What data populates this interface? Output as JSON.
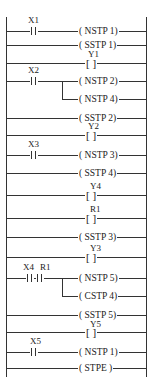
{
  "diagram": {
    "type": "ladder",
    "rungs": [
      {
        "y": 31,
        "contacts": [
          "X1"
        ],
        "output": "( NSTP 1)"
      },
      {
        "y": 45,
        "contacts": [],
        "output": "( SSTP 1)"
      },
      {
        "y": 63,
        "contacts": [],
        "output_label": "Y1",
        "output": "[   ]"
      },
      {
        "y": 81,
        "contacts": [
          "X2"
        ],
        "output": "( NSTP 2)"
      },
      {
        "y": 99,
        "contacts": [],
        "output": "( NSTP 4)",
        "branch": true
      },
      {
        "y": 118,
        "contacts": [],
        "output": "( SSTP 2)"
      },
      {
        "y": 135,
        "contacts": [],
        "output_label": "Y2",
        "output": "[   ]"
      },
      {
        "y": 155,
        "contacts": [
          "X3"
        ],
        "output": "( NSTP 3)"
      },
      {
        "y": 173,
        "contacts": [],
        "output": "( SSTP 4)"
      },
      {
        "y": 195,
        "contacts": [],
        "output_label": "Y4",
        "output": "[   ]"
      },
      {
        "y": 218,
        "contacts": [],
        "output_label": "R1",
        "output": "[   ]"
      },
      {
        "y": 237,
        "contacts": [],
        "output": "( SSTP 3)"
      },
      {
        "y": 257,
        "contacts": [],
        "output_label": "Y3",
        "output": "[   ]"
      },
      {
        "y": 278,
        "contacts": [
          "X4",
          "R1"
        ],
        "output": "( NSTP 5)"
      },
      {
        "y": 296,
        "contacts": [],
        "output": "( CSTP 4)",
        "branch": true
      },
      {
        "y": 315,
        "contacts": [],
        "output": "( SSTP 5)"
      },
      {
        "y": 332,
        "contacts": [],
        "output_label": "Y5",
        "output": "[   ]"
      },
      {
        "y": 352,
        "contacts": [
          "X5"
        ],
        "output": "( NSTP 1)"
      },
      {
        "y": 368,
        "contacts": [],
        "output": "( STPE  )"
      }
    ]
  },
  "labels": {
    "x1": "X1",
    "x2": "X2",
    "x3": "X3",
    "x4": "X4",
    "r1c": "R1",
    "x5": "X5",
    "y1": "Y1",
    "y2": "Y2",
    "y4": "Y4",
    "r1": "R1",
    "y3": "Y3",
    "y5": "Y5",
    "bracket": "[   ]",
    "o1": "( NSTP 1)",
    "o2": "( SSTP 1)",
    "o4": "( NSTP 2)",
    "o5": "( NSTP 4)",
    "o6": "( SSTP 2)",
    "o8": "( NSTP 3)",
    "o9": "( SSTP 4)",
    "o12": "( SSTP 3)",
    "o14": "( NSTP 5)",
    "o15": "( CSTP 4)",
    "o16": "( SSTP 5)",
    "o18": "( NSTP 1)",
    "o19": "( STPE  )"
  }
}
